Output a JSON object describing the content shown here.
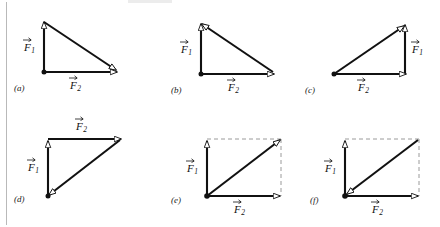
{
  "figure": {
    "background_color": "#ffffff",
    "stroke_color": "#111111",
    "dashed_color": "#9a9a9a",
    "rule_color": "#b9b9b9",
    "vector_names": {
      "f1": "F",
      "f1_sub": "1",
      "f2": "F",
      "f2_sub": "2"
    },
    "panels": [
      {
        "id": "a",
        "label": "(a)",
        "f1_label": "F",
        "f1_sub": "1",
        "f2_label": "F",
        "f2_sub": "2",
        "f1_position": "left-vertical-up",
        "f2_position": "bottom-horizontal-right",
        "resultant": "hypotenuse-from-top-left-to-bottom-right",
        "resultant_arrow_at": "bottom-right",
        "dashed_construction": false
      },
      {
        "id": "b",
        "label": "(b)",
        "f1_label": "F",
        "f1_sub": "1",
        "f2_label": "F",
        "f2_sub": "2",
        "f1_position": "left-vertical-up",
        "f2_position": "bottom-horizontal-right",
        "resultant": "hypotenuse-from-bottom-right-to-top-left",
        "resultant_arrow_at": "top-left",
        "dashed_construction": false
      },
      {
        "id": "c",
        "label": "(c)",
        "f1_label": "F",
        "f1_sub": "1",
        "f2_label": "F",
        "f2_sub": "2",
        "f1_position": "right-vertical-up",
        "f2_position": "bottom-horizontal-right",
        "resultant": "hypotenuse-from-bottom-left-to-top-right",
        "resultant_arrow_at": "top-right",
        "dashed_construction": false
      },
      {
        "id": "d",
        "label": "(d)",
        "f1_label": "F",
        "f1_sub": "1",
        "f2_label": "F",
        "f2_sub": "2",
        "f1_position": "left-vertical-up",
        "f2_position": "top-horizontal-right",
        "resultant": "hypotenuse-from-top-right-to-bottom-left",
        "resultant_arrow_at": "bottom-left",
        "dashed_construction": false
      },
      {
        "id": "e",
        "label": "(e)",
        "f1_label": "F",
        "f1_sub": "1",
        "f2_label": "F",
        "f2_sub": "2",
        "f1_position": "left-vertical-up",
        "f2_position": "bottom-horizontal-right",
        "resultant": "diagonal-from-origin-to-top-right",
        "resultant_arrow_at": "top-right",
        "dashed_construction": true
      },
      {
        "id": "f",
        "label": "(f)",
        "f1_label": "F",
        "f1_sub": "1",
        "f2_label": "F",
        "f2_sub": "2",
        "f1_position": "left-vertical-up",
        "f2_position": "bottom-horizontal-right",
        "resultant": "diagonal-from-top-right-to-origin",
        "resultant_arrow_at": "bottom-left-origin",
        "dashed_construction": true
      }
    ]
  }
}
